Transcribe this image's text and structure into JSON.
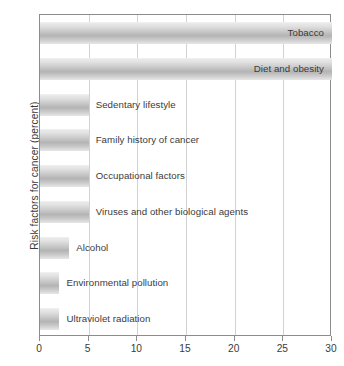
{
  "chart_data": {
    "type": "bar",
    "orientation": "horizontal",
    "title": "",
    "xlabel": "",
    "ylabel": "Risk factors for cancer (percent)",
    "xlim": [
      0,
      30
    ],
    "xticks": [
      0,
      5,
      10,
      15,
      20,
      25,
      30
    ],
    "xtick_labels": [
      "0",
      "5",
      "10",
      "15",
      "20",
      "25",
      "30"
    ],
    "grid": true,
    "grid_axis": "x",
    "legend": false,
    "categories": [
      "Tobacco",
      "Diet and obesity",
      "Sedentary lifestyle",
      "Family history of cancer",
      "Occupational factors",
      "Viruses and other biological agents",
      "Alcohol",
      "Environmental pollution",
      "Ultraviolet radiation"
    ],
    "values": [
      30,
      30,
      5,
      5,
      5,
      5,
      3,
      2,
      2
    ],
    "label_placement": [
      "inside",
      "inside",
      "outside",
      "outside",
      "outside",
      "outside",
      "outside",
      "outside",
      "outside"
    ],
    "colors": {
      "bar_light": "#eaeaea",
      "bar_mid": "#b4b4b4",
      "bar_edge": "#dcdcdc",
      "axis": "#8c8c8c",
      "grid": "#d2d2d2",
      "text": "#3a3a3a",
      "background": "#ffffff"
    }
  }
}
